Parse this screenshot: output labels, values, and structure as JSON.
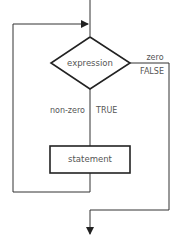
{
  "diagram": {
    "type": "flowchart",
    "nodes": {
      "decision": {
        "label": "expression",
        "shape": "diamond"
      },
      "process": {
        "label": "statement",
        "shape": "rectangle"
      }
    },
    "edges": {
      "false_branch": {
        "label_top": "zero",
        "label_bottom": "FALSE"
      },
      "true_branch": {
        "label_left": "non-zero",
        "label_right": "TRUE"
      }
    },
    "colors": {
      "line": "#333333",
      "text": "#555555",
      "background": "#ffffff"
    }
  }
}
